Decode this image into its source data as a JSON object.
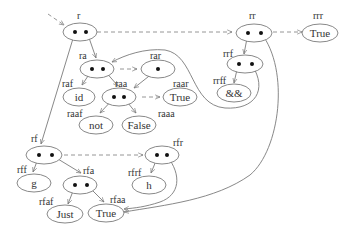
{
  "diagram": {
    "type": "term graph with redirection (dashed) arrows",
    "nodes": [
      {
        "id": "r",
        "label": "r",
        "kind": "binary"
      },
      {
        "id": "ra",
        "label": "ra",
        "kind": "binary"
      },
      {
        "id": "rar",
        "label": "rar",
        "kind": "unary"
      },
      {
        "id": "raf",
        "label": "raf",
        "value": "id"
      },
      {
        "id": "raa",
        "label": "raa",
        "kind": "binary"
      },
      {
        "id": "raar",
        "label": "raar",
        "value": "True"
      },
      {
        "id": "raaf",
        "label": "raaf",
        "value": "not"
      },
      {
        "id": "raaa",
        "label": "raaa",
        "value": "False"
      },
      {
        "id": "rr",
        "label": "rr",
        "kind": "binary"
      },
      {
        "id": "rrr",
        "label": "rrr",
        "value": "True"
      },
      {
        "id": "rrf",
        "label": "rrf",
        "kind": "binary"
      },
      {
        "id": "rrff",
        "label": "rrff",
        "value": "&&"
      },
      {
        "id": "rf",
        "label": "rf",
        "kind": "binary"
      },
      {
        "id": "rff",
        "label": "rff",
        "value": "g"
      },
      {
        "id": "rfa",
        "label": "rfa",
        "kind": "binary"
      },
      {
        "id": "rfaf",
        "label": "rfaf",
        "value": "Just"
      },
      {
        "id": "rfaa",
        "label": "rfaa",
        "value": "True"
      },
      {
        "id": "rfr",
        "label": "rfr",
        "kind": "binary"
      },
      {
        "id": "rfrf",
        "label": "rfrf",
        "value": "h"
      }
    ],
    "edges": [
      {
        "from": "r",
        "to": "rf",
        "style": "solid"
      },
      {
        "from": "r",
        "to": "ra",
        "style": "solid"
      },
      {
        "from": "r",
        "to": "rr",
        "style": "dashed"
      },
      {
        "from": "rr",
        "to": "rrr",
        "style": "dashed"
      },
      {
        "from": "rr",
        "to": "rrf",
        "style": "solid"
      },
      {
        "from": "rr",
        "to": "rfaa",
        "style": "solid"
      },
      {
        "from": "rrf",
        "to": "rrff",
        "style": "solid"
      },
      {
        "from": "rrf",
        "to": "ra",
        "style": "solid"
      },
      {
        "from": "ra",
        "to": "raf",
        "style": "solid"
      },
      {
        "from": "ra",
        "to": "raa",
        "style": "solid"
      },
      {
        "from": "ra",
        "to": "rar",
        "style": "dashed"
      },
      {
        "from": "rar",
        "to": "raa",
        "style": "solid"
      },
      {
        "from": "raa",
        "to": "raaf",
        "style": "solid"
      },
      {
        "from": "raa",
        "to": "raaa",
        "style": "solid"
      },
      {
        "from": "raa",
        "to": "raar",
        "style": "dashed"
      },
      {
        "from": "rf",
        "to": "rff",
        "style": "solid"
      },
      {
        "from": "rf",
        "to": "rfa",
        "style": "solid"
      },
      {
        "from": "rf",
        "to": "rfr",
        "style": "dashed"
      },
      {
        "from": "rfa",
        "to": "rfaf",
        "style": "solid"
      },
      {
        "from": "rfa",
        "to": "rfaa",
        "style": "solid"
      },
      {
        "from": "rfr",
        "to": "rfrf",
        "style": "solid"
      },
      {
        "from": "rfr",
        "to": "rfaa",
        "style": "solid"
      }
    ],
    "labels": {
      "r": "r",
      "ra": "ra",
      "rar": "rar",
      "raf": "raf",
      "raa": "raa",
      "raar": "raar",
      "raaf": "raaf",
      "raaa": "raaa",
      "rr": "rr",
      "rrr": "rrr",
      "rrf": "rrf",
      "rrff": "rrff",
      "rf": "rf",
      "rff": "rff",
      "rfa": "rfa",
      "rfaf": "rfaf",
      "rfaa": "rfaa",
      "rfr": "rfr",
      "rfrf": "rfrf"
    },
    "values": {
      "raf": "id",
      "raar": "True",
      "raaf": "not",
      "raaa": "False",
      "rrr": "True",
      "rrff": "&&",
      "rff": "g",
      "rfaf": "Just",
      "rfaa": "True",
      "rfrf": "h"
    }
  }
}
